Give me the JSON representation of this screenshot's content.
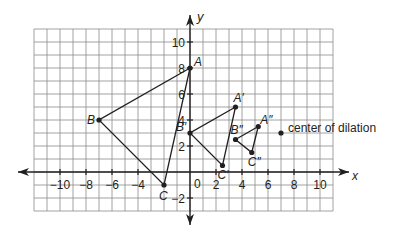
{
  "diagram": {
    "type": "coordinate-plane-dilation",
    "axes": {
      "x_label": "x",
      "y_label": "y",
      "x_ticks": [
        "−10",
        "−8",
        "−6",
        "−4",
        "2",
        "4",
        "6",
        "8",
        "10"
      ],
      "y_ticks": [
        "10",
        "8",
        "6",
        "4",
        "2",
        "−2"
      ],
      "origin_label": "0",
      "x_range": [
        -11,
        11
      ],
      "y_range": [
        -3,
        11
      ]
    },
    "colors": {
      "grid": "#8a8a8a",
      "axis": "#231f20",
      "line": "#231f20",
      "text": "#231f20"
    },
    "center": {
      "label": "center of dilation",
      "x": 7,
      "y": 3
    },
    "triangles": [
      {
        "name": "ABC",
        "vertices": [
          {
            "label": "A",
            "x": 0,
            "y": 8
          },
          {
            "label": "B",
            "x": -7,
            "y": 4
          },
          {
            "label": "C",
            "x": -2,
            "y": -1
          }
        ]
      },
      {
        "name": "A'B'C'",
        "vertices": [
          {
            "label": "A′",
            "x": 3.5,
            "y": 5
          },
          {
            "label": "B′",
            "x": 0,
            "y": 3
          },
          {
            "label": "C′",
            "x": 2.5,
            "y": 0.5
          }
        ]
      },
      {
        "name": "A''B''C''",
        "vertices": [
          {
            "label": "A″",
            "x": 5.25,
            "y": 3.5
          },
          {
            "label": "B″",
            "x": 3.5,
            "y": 2.5
          },
          {
            "label": "C″",
            "x": 4.75,
            "y": 1.5
          }
        ]
      }
    ]
  }
}
